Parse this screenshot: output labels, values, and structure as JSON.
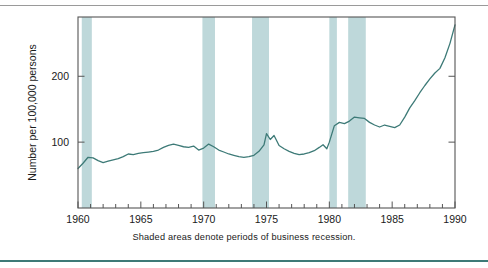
{
  "figure": {
    "caption": "Shaded areas denote periods of business recession.",
    "top_rule_color": "#9a9a9a",
    "bottom_rule_color": "#3d7a77"
  },
  "chart_data": {
    "type": "line",
    "title": "",
    "subtitle": "",
    "xlabel": "",
    "ylabel": "Number per 100,000 persons",
    "xlim": [
      1960,
      1990
    ],
    "ylim": [
      0,
      290
    ],
    "grid": false,
    "legend": "none",
    "line_color": "#3d7a77",
    "band_color": "#bed8da",
    "frame_color": "#555555",
    "y_ticks_major": [
      100,
      200
    ],
    "y_tick_labels": [
      "100",
      "200"
    ],
    "x_ticks_major": [
      1960,
      1965,
      1970,
      1975,
      1980,
      1985,
      1990
    ],
    "x_tick_labels": [
      "1960",
      "1965",
      "1970",
      "1975",
      "1980",
      "1985",
      "1990"
    ],
    "x_ticks_minor_step": 1,
    "annotations": [
      "Shaded areas denote periods of business recession."
    ],
    "shaded_regions": [
      {
        "label": "recession 1960-1961",
        "start": 1960.3,
        "end": 1961.1
      },
      {
        "label": "recession 1969-1970",
        "start": 1969.9,
        "end": 1970.9
      },
      {
        "label": "recession 1973-1975",
        "start": 1973.85,
        "end": 1975.2
      },
      {
        "label": "recession 1980",
        "start": 1980.0,
        "end": 1980.6
      },
      {
        "label": "recession 1981-1982",
        "start": 1981.5,
        "end": 1982.9
      }
    ],
    "series": [
      {
        "name": "Rate per 100,000 persons",
        "x": [
          1960.0,
          1960.4,
          1960.8,
          1961.2,
          1961.6,
          1962.0,
          1962.4,
          1962.8,
          1963.2,
          1963.6,
          1964.0,
          1964.4,
          1964.8,
          1965.2,
          1965.6,
          1966.0,
          1966.4,
          1966.8,
          1967.2,
          1967.6,
          1968.0,
          1968.4,
          1968.8,
          1969.2,
          1969.6,
          1970.0,
          1970.4,
          1970.8,
          1971.2,
          1971.6,
          1972.0,
          1972.4,
          1972.8,
          1973.2,
          1973.6,
          1974.0,
          1974.4,
          1974.8,
          1975.0,
          1975.3,
          1975.6,
          1976.0,
          1976.4,
          1976.8,
          1977.2,
          1977.6,
          1978.0,
          1978.4,
          1978.8,
          1979.2,
          1979.5,
          1979.8,
          1980.0,
          1980.4,
          1980.8,
          1981.2,
          1981.6,
          1982.0,
          1982.4,
          1982.8,
          1983.2,
          1983.6,
          1984.0,
          1984.4,
          1984.8,
          1985.2,
          1985.6,
          1986.0,
          1986.4,
          1986.8,
          1987.2,
          1987.6,
          1988.0,
          1988.4,
          1988.8,
          1989.2,
          1989.6,
          1990.0
        ],
        "values": [
          60,
          68,
          77,
          76,
          72,
          69,
          71,
          73,
          75,
          78,
          82,
          81,
          83,
          84,
          85,
          86,
          88,
          92,
          95,
          97,
          95,
          93,
          92,
          94,
          88,
          91,
          97,
          93,
          88,
          85,
          82,
          80,
          78,
          77,
          78,
          80,
          86,
          96,
          113,
          104,
          110,
          95,
          90,
          86,
          83,
          81,
          82,
          84,
          87,
          92,
          96,
          90,
          100,
          125,
          130,
          128,
          132,
          138,
          137,
          136,
          130,
          126,
          123,
          126,
          124,
          122,
          126,
          138,
          152,
          163,
          175,
          186,
          196,
          205,
          212,
          228,
          250,
          278
        ],
        "color": "#3d7a77"
      }
    ]
  }
}
